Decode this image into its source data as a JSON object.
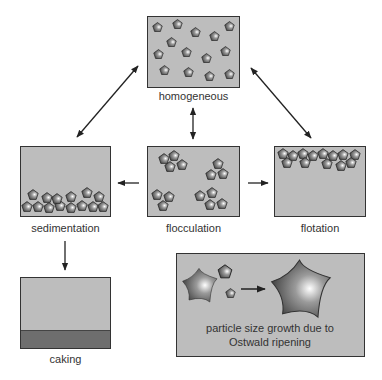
{
  "panels": {
    "homogeneous": {
      "label": "homogeneous"
    },
    "sedimentation": {
      "label": "sedimentation"
    },
    "flocculation": {
      "label": "flocculation"
    },
    "flotation": {
      "label": "flotation"
    },
    "caking": {
      "label": "caking"
    },
    "ostwald": {
      "line1": "particle size growth due to",
      "line2": "Ostwald ripening"
    }
  },
  "colors": {
    "panel_fill": "#bdbdbd",
    "caking_layer": "#6e6e6e",
    "border": "#333333",
    "arrow": "#222222"
  }
}
